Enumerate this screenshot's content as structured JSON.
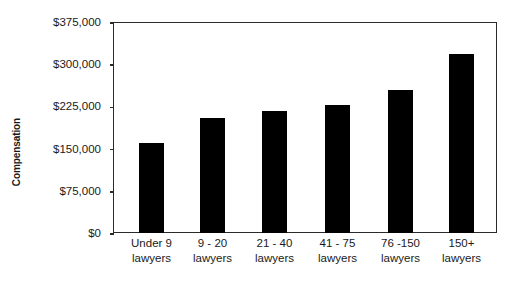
{
  "chart_data": {
    "type": "bar",
    "title": "",
    "xlabel": "",
    "ylabel": "Compensation",
    "categories": [
      "Under 9 lawyers",
      "9 - 20 lawyers",
      "21 - 40 lawyers",
      "41 - 75 lawyers",
      "76 -150 lawyers",
      "150+ lawyers"
    ],
    "category_lines": [
      [
        "Under 9",
        "lawyers"
      ],
      [
        "9 - 20",
        "lawyers"
      ],
      [
        "21 - 40",
        "lawyers"
      ],
      [
        "41 - 75",
        "lawyers"
      ],
      [
        "76 -150",
        "lawyers"
      ],
      [
        "150+",
        "lawyers"
      ]
    ],
    "values": [
      160000,
      204000,
      216000,
      228000,
      255000,
      318000
    ],
    "ylim": [
      0,
      375000
    ],
    "ytick_values": [
      0,
      75000,
      150000,
      225000,
      300000,
      375000
    ],
    "ytick_labels": [
      "$0",
      "$75,000",
      "$150,000",
      "$225,000",
      "$300,000",
      "$375,000"
    ],
    "grid": false,
    "legend": false,
    "bar_color": "#000000",
    "axis_color": "#2b2b2b",
    "background_color": "#ffffff"
  }
}
